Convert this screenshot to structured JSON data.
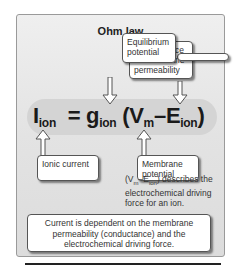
{
  "figure": {
    "title": "Ohm law",
    "equation": {
      "lhs_main": "I",
      "lhs_sub": "ion",
      "equals": "=",
      "g_main": "g",
      "g_sub": "ion",
      "open": "(V",
      "vm_sub": "m",
      "minus": "–E",
      "e_sub": "ion",
      "close": ")"
    },
    "callouts": {
      "conductance": "Conductance or membrane permeability",
      "equilibrium": "Equilibrium potential",
      "ionic": "Ionic current",
      "membrane": "Membrane potential"
    },
    "note": {
      "prefix": "(V",
      "vm_sub": "m",
      "mid": "–E",
      "e_sub": "ion",
      "suffix": ") describes the electrochemical driving force for an ion."
    },
    "summary": "Current is dependent on the membrane permeability (conductance) and the electrochemical driving force.",
    "colors": {
      "panel_bg": "#e3e3e3",
      "band": "#d4d4d4",
      "text": "#222222",
      "callout_bg": "#ffffff"
    }
  }
}
